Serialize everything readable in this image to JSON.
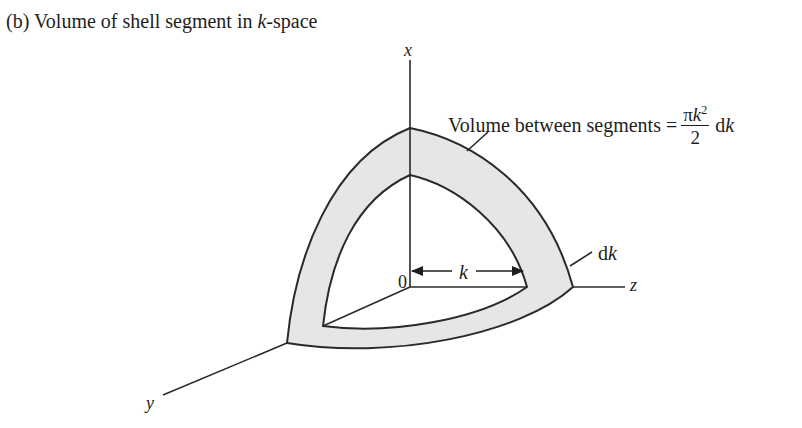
{
  "caption": {
    "prefix": "(b) Volume of shell segment in ",
    "var": "k",
    "suffix": "-space"
  },
  "axes": {
    "x_label": "x",
    "y_label": "y",
    "z_label": "z",
    "origin_label": "0"
  },
  "annotations": {
    "volume_text": "Volume between segments =",
    "formula_numerator_pi": "π",
    "formula_numerator_var": "k",
    "formula_numerator_exp": "2",
    "formula_denominator": "2",
    "formula_suffix_d": "d",
    "formula_suffix_var": "k",
    "shell_thickness_d": "d",
    "shell_thickness_var": "k",
    "radius_label": "k"
  },
  "colors": {
    "shell_fill": "#e6e6e6",
    "stroke": "#2a2a2a",
    "background": "#ffffff"
  }
}
